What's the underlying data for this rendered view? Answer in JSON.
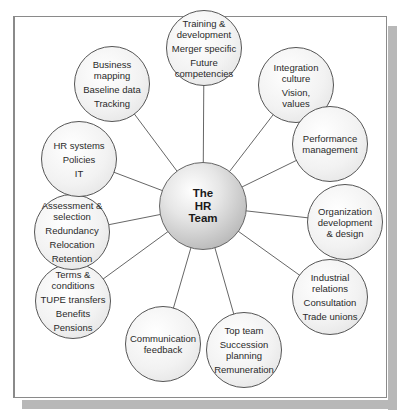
{
  "diagram": {
    "center": {
      "lines": [
        "The",
        "HR",
        "Team"
      ]
    },
    "nodes": [
      {
        "id": "training",
        "groups": [
          "Training & development",
          "Merger specific",
          "Future competencies"
        ]
      },
      {
        "id": "integration",
        "groups": [
          "Integration culture",
          "Vision, values"
        ]
      },
      {
        "id": "performance",
        "groups": [
          "Performance management"
        ]
      },
      {
        "id": "organization",
        "groups": [
          "Organization development & design"
        ]
      },
      {
        "id": "industrial",
        "groups": [
          "Industrial relations",
          "Consultation",
          "Trade unions"
        ]
      },
      {
        "id": "topteam",
        "groups": [
          "Top team",
          "Succession planning",
          "Remuneration"
        ]
      },
      {
        "id": "communication",
        "groups": [
          "Communication feedback"
        ]
      },
      {
        "id": "terms",
        "groups": [
          "Terms & conditions",
          "TUPE transfers",
          "Benefits",
          "Pensions"
        ]
      },
      {
        "id": "assessment",
        "groups": [
          "Assessment & selection",
          "Redundancy",
          "Relocation",
          "Retention"
        ]
      },
      {
        "id": "hrsystems",
        "groups": [
          "HR systems",
          "Policies",
          "IT"
        ]
      },
      {
        "id": "business",
        "groups": [
          "Business mapping",
          "Baseline data",
          "Tracking"
        ]
      }
    ]
  }
}
